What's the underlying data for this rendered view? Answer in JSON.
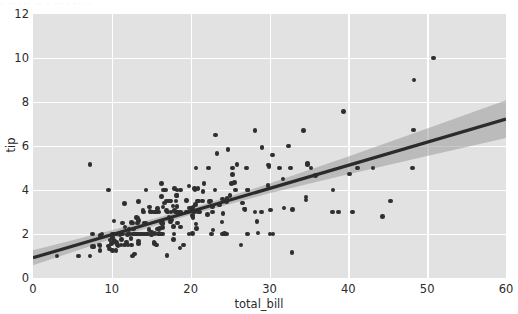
{
  "figure": {
    "background_color": "#ffffff",
    "axes_background_color": "#e2e2e2",
    "grid_color": "#ffffff",
    "top_artifact_text": "·  ·· ···  ··  · ····  ··· ·"
  },
  "chart_data": {
    "type": "scatter",
    "title": "",
    "xlabel": "total_bill",
    "ylabel": "tip",
    "xlim": [
      0,
      60
    ],
    "ylim": [
      0,
      12
    ],
    "xticks": [
      0,
      10,
      20,
      30,
      40,
      50,
      60
    ],
    "yticks": [
      0,
      2,
      4,
      6,
      8,
      10,
      12
    ],
    "xticklabels": [
      "0",
      "10",
      "20",
      "30",
      "40",
      "50",
      "60"
    ],
    "yticklabels": [
      "0",
      "2",
      "4",
      "6",
      "8",
      "10",
      "12"
    ],
    "grid": true,
    "legend": null,
    "marker_color": "#2f2f2f",
    "marker_size": 4.6,
    "regression": {
      "visible": true,
      "line_color": "#2b2b2b",
      "line_width": 3.2,
      "ci_color": "#9a9a9a",
      "ci_opacity": 0.55,
      "intercept": 0.92,
      "slope": 0.105,
      "ci_halfwidth_at_x": [
        {
          "x": 0,
          "w": 0.34
        },
        {
          "x": 10,
          "w": 0.2
        },
        {
          "x": 20,
          "w": 0.14
        },
        {
          "x": 30,
          "w": 0.22
        },
        {
          "x": 40,
          "w": 0.4
        },
        {
          "x": 50,
          "w": 0.62
        },
        {
          "x": 60,
          "w": 0.86
        }
      ]
    },
    "series": [
      {
        "name": "tips",
        "x": [
          16.99,
          10.34,
          21.01,
          23.68,
          24.59,
          25.29,
          8.77,
          26.88,
          15.04,
          14.78,
          10.27,
          35.26,
          15.42,
          18.43,
          14.83,
          21.58,
          10.33,
          16.29,
          16.97,
          20.65,
          17.92,
          20.29,
          15.77,
          39.42,
          19.82,
          17.81,
          13.37,
          12.69,
          21.7,
          19.65,
          9.55,
          18.35,
          15.06,
          20.69,
          17.78,
          24.06,
          16.31,
          16.93,
          18.69,
          31.27,
          16.04,
          17.46,
          13.94,
          9.68,
          30.4,
          18.29,
          22.23,
          32.4,
          28.55,
          18.04,
          12.54,
          10.29,
          34.81,
          9.94,
          25.56,
          19.49,
          38.01,
          26.41,
          11.24,
          48.27,
          20.29,
          13.81,
          11.02,
          18.29,
          17.59,
          20.08,
          16.45,
          3.07,
          20.23,
          15.01,
          12.02,
          17.07,
          26.86,
          25.28,
          14.73,
          10.51,
          17.92,
          27.2,
          22.76,
          17.29,
          19.44,
          16.66,
          10.07,
          32.68,
          15.98,
          34.83,
          13.03,
          18.28,
          24.71,
          21.16,
          28.97,
          22.49,
          5.75,
          16.32,
          22.75,
          40.17,
          27.28,
          12.03,
          21.01,
          12.46,
          11.35,
          15.38,
          44.3,
          22.42,
          20.92,
          15.36,
          20.49,
          25.21,
          18.24,
          14.31,
          14.0,
          7.25,
          38.07,
          23.95,
          25.71,
          17.31,
          29.93,
          10.65,
          12.43,
          24.08,
          11.69,
          13.42,
          14.26,
          15.95,
          12.48,
          29.8,
          8.52,
          14.52,
          11.38,
          22.82,
          19.08,
          20.27,
          11.17,
          12.26,
          18.26,
          8.51,
          10.33,
          14.15,
          16.0,
          13.16,
          17.47,
          34.3,
          41.19,
          27.05,
          16.43,
          8.35,
          18.64,
          11.87,
          9.78,
          7.51,
          14.07,
          13.13,
          17.26,
          24.55,
          19.77,
          29.85,
          48.17,
          25.0,
          13.39,
          16.49,
          21.5,
          12.66,
          16.21,
          13.81,
          17.51,
          24.52,
          20.76,
          31.71,
          10.59,
          10.63,
          50.81,
          15.81,
          7.25,
          31.85,
          16.82,
          32.9,
          17.89,
          14.48,
          9.6,
          34.63,
          34.65,
          23.33,
          45.35,
          23.17,
          40.55,
          20.69,
          20.9,
          30.46,
          18.15,
          23.1,
          15.69,
          19.81,
          28.44,
          15.48,
          16.58,
          7.56,
          10.34,
          43.11,
          13.0,
          13.51,
          18.71,
          12.74,
          13.0,
          16.4,
          20.53,
          16.47,
          26.59,
          38.73,
          24.27,
          12.76,
          30.06,
          25.89,
          48.33,
          13.27,
          28.17,
          12.9,
          28.15,
          11.59,
          7.74,
          30.14,
          12.16,
          13.42,
          8.58,
          15.98,
          13.42,
          16.27,
          10.09,
          20.45,
          13.28,
          22.12,
          24.01,
          15.69,
          11.61,
          10.77,
          15.53,
          10.07,
          12.6,
          32.83,
          35.83,
          29.03,
          27.18,
          22.67,
          17.82,
          18.78
        ],
        "y": [
          1.01,
          1.66,
          3.5,
          3.31,
          3.61,
          4.71,
          2.0,
          3.12,
          1.96,
          3.23,
          1.71,
          5.0,
          1.57,
          3.0,
          3.02,
          3.92,
          1.67,
          3.71,
          3.5,
          3.35,
          4.08,
          2.75,
          2.23,
          7.58,
          3.18,
          2.34,
          2.0,
          2.0,
          4.3,
          3.0,
          1.45,
          2.5,
          3.0,
          2.45,
          3.27,
          3.6,
          2.0,
          3.07,
          2.31,
          5.0,
          2.24,
          2.54,
          3.06,
          1.32,
          5.6,
          3.0,
          5.0,
          6.0,
          2.05,
          3.0,
          2.5,
          2.6,
          5.2,
          1.56,
          4.34,
          3.51,
          3.0,
          1.5,
          1.76,
          6.73,
          3.21,
          2.0,
          1.98,
          3.76,
          2.64,
          3.15,
          2.47,
          1.0,
          2.01,
          2.09,
          1.97,
          3.0,
          3.14,
          5.0,
          2.2,
          1.25,
          3.08,
          4.0,
          3.0,
          2.71,
          3.0,
          3.4,
          1.83,
          5.0,
          2.03,
          5.17,
          2.0,
          4.0,
          5.85,
          3.0,
          3.0,
          3.5,
          1.0,
          4.3,
          3.25,
          4.73,
          4.0,
          1.5,
          3.0,
          1.5,
          2.5,
          3.0,
          2.8,
          3.48,
          4.08,
          1.64,
          4.06,
          4.29,
          3.76,
          4.0,
          3.0,
          1.0,
          4.0,
          2.55,
          4.0,
          3.5,
          5.07,
          1.5,
          1.8,
          2.92,
          2.31,
          1.68,
          2.5,
          2.0,
          2.52,
          4.2,
          1.48,
          2.0,
          2.0,
          2.18,
          1.5,
          2.83,
          1.5,
          2.0,
          3.25,
          1.25,
          2.0,
          2.0,
          2.0,
          2.75,
          3.5,
          6.7,
          5.0,
          5.0,
          2.3,
          1.5,
          1.36,
          1.63,
          1.73,
          2.0,
          2.5,
          2.0,
          2.74,
          2.0,
          2.0,
          5.14,
          5.0,
          3.75,
          2.61,
          2.0,
          3.5,
          2.5,
          2.0,
          2.0,
          3.0,
          3.48,
          2.24,
          4.5,
          1.61,
          2.0,
          10.0,
          3.16,
          5.15,
          3.18,
          4.0,
          3.11,
          2.0,
          2.0,
          4.0,
          3.55,
          3.68,
          5.65,
          3.5,
          6.5,
          3.0,
          5.0,
          3.5,
          2.0,
          3.5,
          4.0,
          1.5,
          4.19,
          2.56,
          2.02,
          4.0,
          1.44,
          2.0,
          5.0,
          2.0,
          2.0,
          4.0,
          2.0,
          2.0,
          2.5,
          4.0,
          3.23,
          3.41,
          3.0,
          2.03,
          2.23,
          2.0,
          5.16,
          9.0,
          2.5,
          6.7,
          1.1,
          3.0,
          1.5,
          1.44,
          3.09,
          2.2,
          3.48,
          1.92,
          3.0,
          1.58,
          2.5,
          2.0,
          3.0,
          2.72,
          2.88,
          2.0,
          3.0,
          3.39,
          1.47,
          3.0,
          1.25,
          1.0,
          1.17,
          4.67,
          5.92,
          2.0,
          2.0,
          1.75,
          3.0
        ]
      }
    ]
  }
}
